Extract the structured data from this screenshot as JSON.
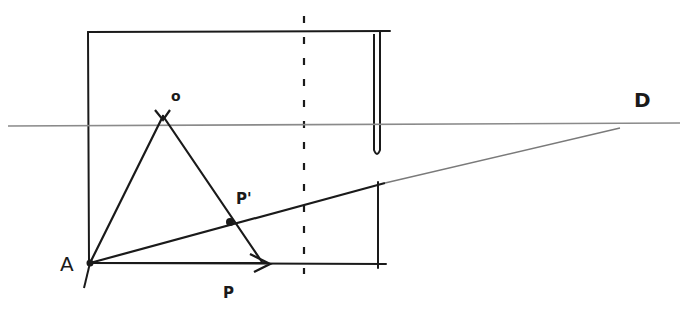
{
  "diagram": {
    "type": "hand-drawn perspective sketch",
    "colors": {
      "ink": "#1a1a1a",
      "faint": "#9a9a9a",
      "background": "#ffffff"
    },
    "labels": {
      "O": "o",
      "D": "D",
      "A": "A",
      "P": "P",
      "P_prime": "P'"
    },
    "points": {
      "A": [
        90,
        263
      ],
      "O": [
        163,
        118
      ],
      "P": [
        268,
        263
      ],
      "P_prime": [
        230,
        222
      ],
      "D": [
        630,
        125
      ]
    },
    "lines": [
      "horizon line",
      "A to O",
      "O to P",
      "A to P (arrow)",
      "A to D (vanishing line)",
      "rectangle frame",
      "dashed vertical line",
      "right vertical edge"
    ]
  }
}
